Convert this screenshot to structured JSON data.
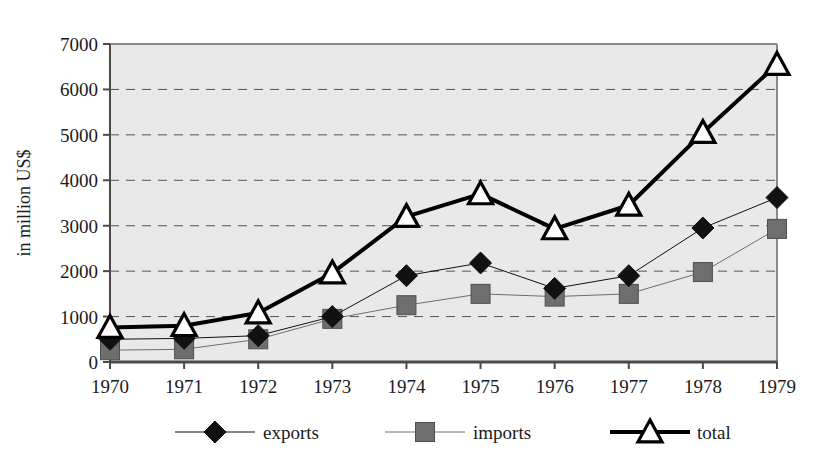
{
  "chart_data": {
    "type": "line",
    "title": "",
    "xlabel": "",
    "ylabel": "in million US$",
    "categories": [
      "1970",
      "1971",
      "1972",
      "1973",
      "1974",
      "1975",
      "1976",
      "1977",
      "1978",
      "1979"
    ],
    "x": [
      1970,
      1971,
      1972,
      1973,
      1974,
      1975,
      1976,
      1977,
      1978,
      1979
    ],
    "ylim": [
      0,
      7000
    ],
    "xlim": [
      1970,
      1979
    ],
    "ytick_labels": [
      "0",
      "1000",
      "2000",
      "3000",
      "4000",
      "5000",
      "6000",
      "7000"
    ],
    "ytick_values": [
      0,
      1000,
      2000,
      3000,
      4000,
      5000,
      6000,
      7000
    ],
    "grid": true,
    "grid_style": "dashed-horizontal",
    "legend_position": "bottom",
    "plot_background": "#e9e9e9",
    "series": [
      {
        "name": "exports",
        "marker": "filled-diamond",
        "color": "#111111",
        "line_width": 1,
        "values": [
          500,
          520,
          580,
          1000,
          1900,
          2180,
          1620,
          1900,
          2950,
          3620
        ]
      },
      {
        "name": "imports",
        "marker": "filled-square",
        "color": "#6e6e6e",
        "line_width": 1,
        "values": [
          260,
          280,
          500,
          950,
          1250,
          1500,
          1440,
          1500,
          1980,
          2930
        ]
      },
      {
        "name": "total",
        "marker": "open-triangle",
        "color": "#000000",
        "line_width": 4,
        "values": [
          760,
          800,
          1080,
          1960,
          3200,
          3700,
          2930,
          3450,
          5050,
          6550
        ]
      }
    ]
  },
  "legend": {
    "items": [
      {
        "label": "exports",
        "marker": "filled-diamond"
      },
      {
        "label": "imports",
        "marker": "filled-square"
      },
      {
        "label": "total",
        "marker": "open-triangle"
      }
    ]
  },
  "axes": {
    "y_title": "in million US$"
  }
}
